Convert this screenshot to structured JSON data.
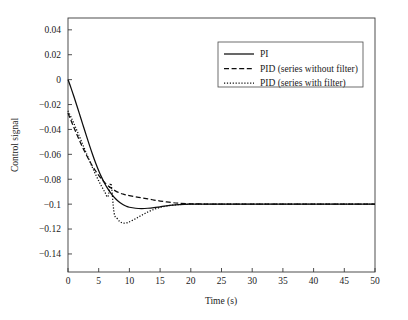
{
  "chart_data": {
    "type": "line",
    "title": "",
    "xlabel": "Time (s)",
    "ylabel": "Control signal",
    "xlim": [
      0,
      50
    ],
    "ylim": [
      -0.1545,
      0.0495
    ],
    "grid": false,
    "legend_position": "upper right",
    "xticks": [
      0,
      5,
      10,
      15,
      20,
      25,
      30,
      35,
      40,
      45,
      50
    ],
    "xtick_labels": [
      "0",
      "5",
      "10",
      "15",
      "20",
      "25",
      "30",
      "35",
      "40",
      "45",
      "50"
    ],
    "yticks": [
      0.04,
      0.02,
      0,
      -0.02,
      -0.04,
      -0.06,
      -0.08,
      -0.1,
      -0.12,
      -0.14
    ],
    "ytick_labels": [
      "0.04",
      "0.02",
      "0",
      "−0.02",
      "−0.04",
      "−0.06",
      "−0.08",
      "−0.1",
      "−0.12",
      "−0.14"
    ],
    "x": [
      0,
      0.5,
      1,
      1.5,
      2,
      2.5,
      3,
      3.5,
      4,
      4.5,
      5,
      5.5,
      6,
      6.5,
      7,
      7.5,
      8,
      8.5,
      9,
      9.5,
      10,
      11,
      12,
      13,
      14,
      15,
      16,
      17,
      18,
      20,
      22,
      25,
      30,
      35,
      40,
      45,
      50
    ],
    "series": [
      {
        "name": "PI",
        "style": "solid",
        "color": "#0d0d0d",
        "values": [
          0,
          -0.0068,
          -0.0142,
          -0.0218,
          -0.0296,
          -0.0374,
          -0.0452,
          -0.0528,
          -0.0601,
          -0.0669,
          -0.0731,
          -0.0787,
          -0.0836,
          -0.0878,
          -0.0914,
          -0.0944,
          -0.0969,
          -0.0989,
          -0.1005,
          -0.1017,
          -0.1025,
          -0.1033,
          -0.1035,
          -0.1033,
          -0.1028,
          -0.1021,
          -0.1014,
          -0.1008,
          -0.1004,
          -0.1,
          -0.0999,
          -0.1,
          -0.1,
          -0.1,
          -0.1,
          -0.1,
          -0.1
        ]
      },
      {
        "name": "PID (series without filter)",
        "style": "dashed",
        "color": "#0d0d0d",
        "values": [
          -0.0268,
          -0.0329,
          -0.0389,
          -0.0447,
          -0.0503,
          -0.0556,
          -0.0606,
          -0.0652,
          -0.0695,
          -0.0734,
          -0.0769,
          -0.08,
          -0.0827,
          -0.0851,
          -0.0871,
          -0.0887,
          -0.0901,
          -0.0912,
          -0.092,
          -0.0927,
          -0.0932,
          -0.0941,
          -0.0949,
          -0.0958,
          -0.0967,
          -0.0975,
          -0.0982,
          -0.0988,
          -0.0992,
          -0.0997,
          -0.0999,
          -0.1,
          -0.1,
          -0.1,
          -0.1,
          -0.1,
          -0.1
        ]
      },
      {
        "name": "PID (series with filter)",
        "style": "dotted",
        "color": "#0d0d0d",
        "values": [
          -0.0251,
          -0.0302,
          -0.0357,
          -0.0414,
          -0.0473,
          -0.0533,
          -0.0592,
          -0.0651,
          -0.0708,
          -0.0762,
          -0.0813,
          -0.086,
          -0.0903,
          -0.0941,
          -0.0835,
          -0.1068,
          -0.1115,
          -0.1142,
          -0.1152,
          -0.115,
          -0.1142,
          -0.1117,
          -0.1089,
          -0.1063,
          -0.1042,
          -0.1026,
          -0.1015,
          -0.1008,
          -0.1004,
          -0.1,
          -0.0999,
          -0.0999,
          -0.1,
          -0.1,
          -0.1,
          -0.1,
          -0.1
        ]
      }
    ],
    "annotations": []
  },
  "legend": {
    "entries": [
      {
        "label": "PI"
      },
      {
        "label": "PID (series without filter)"
      },
      {
        "label": "PID (series with filter)"
      }
    ]
  }
}
